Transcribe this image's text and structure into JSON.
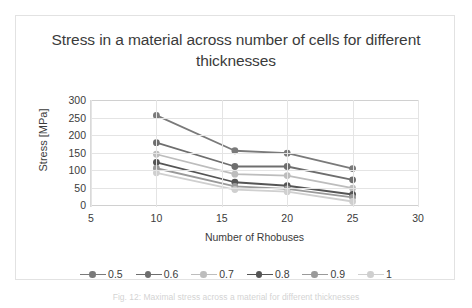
{
  "chart_data": {
    "type": "line",
    "title": "Stress in a material across number of cells for different thicknesses",
    "xlabel": "Number of Rhobuses",
    "ylabel": "Stress [MPa]",
    "x": [
      10,
      16,
      20,
      25
    ],
    "xlim": [
      5,
      30
    ],
    "ylim": [
      0,
      300
    ],
    "xticks": [
      "5",
      "10",
      "15",
      "20",
      "25",
      "30"
    ],
    "yticks": [
      "0",
      "50",
      "100",
      "150",
      "200",
      "250",
      "300"
    ],
    "grid": true,
    "legend_position": "bottom",
    "series": [
      {
        "name": "0.5",
        "values": [
          256,
          155,
          148,
          104
        ],
        "color": "#7a7a7a"
      },
      {
        "name": "0.6",
        "values": [
          178,
          110,
          110,
          72
        ],
        "color": "#6e6e6e"
      },
      {
        "name": "0.7",
        "values": [
          145,
          88,
          84,
          48
        ],
        "color": "#bdbdbd"
      },
      {
        "name": "0.8",
        "values": [
          122,
          65,
          55,
          30
        ],
        "color": "#555555"
      },
      {
        "name": "0.9",
        "values": [
          105,
          53,
          46,
          22
        ],
        "color": "#9a9a9a"
      },
      {
        "name": "1",
        "values": [
          92,
          44,
          38,
          10
        ],
        "color": "#cfcfcf"
      }
    ]
  },
  "caption": {
    "text": "Fig. 12:  Maximal stress across a material for different thicknesses"
  }
}
